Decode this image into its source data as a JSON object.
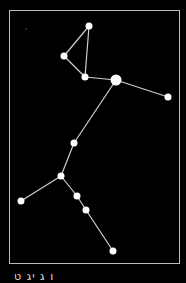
{
  "diagram": {
    "frame": {
      "x": 9,
      "y": 10,
      "w": 171,
      "h": 254,
      "color": "#bdbdbd"
    },
    "line_color": "#cfcfcf",
    "star_color": "#ffffff",
    "stars": [
      {
        "id": "s1",
        "x": 89,
        "y": 26,
        "r": 3.5
      },
      {
        "id": "s2",
        "x": 64,
        "y": 56,
        "r": 3.5
      },
      {
        "id": "s3",
        "x": 85,
        "y": 77,
        "r": 3.5
      },
      {
        "id": "s4",
        "x": 116,
        "y": 80,
        "r": 5.5
      },
      {
        "id": "s5",
        "x": 168,
        "y": 97,
        "r": 3.5
      },
      {
        "id": "s6",
        "x": 74,
        "y": 143,
        "r": 3.5
      },
      {
        "id": "s7",
        "x": 61,
        "y": 176,
        "r": 3.5
      },
      {
        "id": "s8",
        "x": 21,
        "y": 201,
        "r": 3.5
      },
      {
        "id": "s9",
        "x": 77,
        "y": 196,
        "r": 3.5
      },
      {
        "id": "s10",
        "x": 86,
        "y": 210,
        "r": 3.5
      },
      {
        "id": "s11",
        "x": 113,
        "y": 251,
        "r": 3.5
      }
    ],
    "faint_stars": [
      {
        "x": 26,
        "y": 29,
        "r": 0.8
      }
    ],
    "edges": [
      [
        "s1",
        "s2"
      ],
      [
        "s1",
        "s3"
      ],
      [
        "s2",
        "s3"
      ],
      [
        "s3",
        "s4"
      ],
      [
        "s4",
        "s5"
      ],
      [
        "s4",
        "s6"
      ],
      [
        "s6",
        "s7"
      ],
      [
        "s7",
        "s8"
      ],
      [
        "s7",
        "s9"
      ],
      [
        "s9",
        "s10"
      ],
      [
        "s10",
        "s11"
      ]
    ]
  },
  "caption": "ו ג יג ט"
}
